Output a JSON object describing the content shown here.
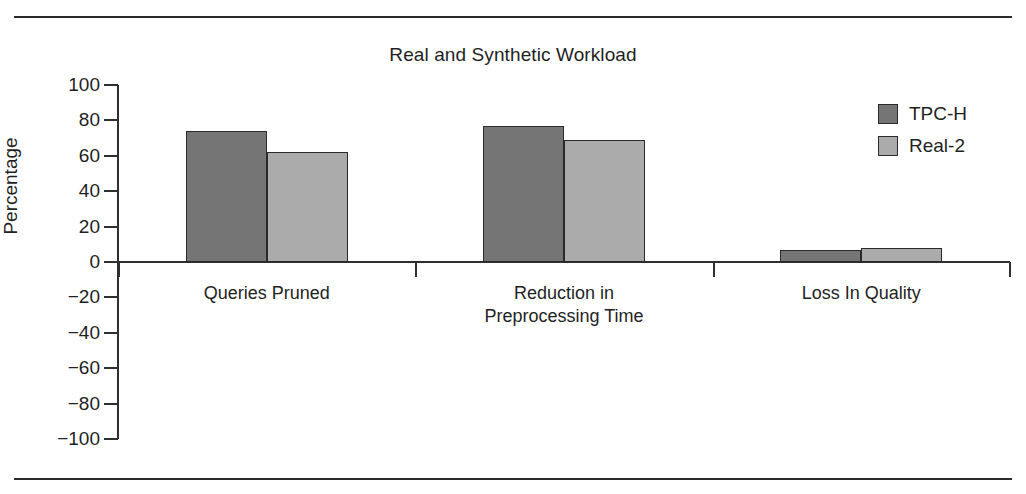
{
  "chart_data": {
    "type": "bar",
    "title": "Real and Synthetic Workload",
    "xlabel": "",
    "ylabel": "Percentage",
    "ylim": [
      -100,
      100
    ],
    "yticks": [
      100,
      80,
      60,
      40,
      20,
      0,
      -20,
      -40,
      -60,
      -80,
      -100
    ],
    "ytick_labels": [
      "100",
      "80",
      "60",
      "40",
      "20",
      "0",
      "−20",
      "−40",
      "−60",
      "−80",
      "−100"
    ],
    "grid": false,
    "legend_position": "top-right",
    "categories": [
      "Queries Pruned",
      "Reduction in\nPreprocessing Time",
      "Loss In Quality"
    ],
    "category_lines": [
      [
        "Queries Pruned"
      ],
      [
        "Reduction in",
        "Preprocessing Time"
      ],
      [
        "Loss In Quality"
      ]
    ],
    "series": [
      {
        "name": "TPC-H",
        "color": "#757575",
        "values": [
          74,
          77,
          7
        ]
      },
      {
        "name": "Real-2",
        "color": "#ababab",
        "values": [
          62,
          69,
          8
        ]
      }
    ]
  },
  "figure": {
    "top_rule": "horizontal-rule",
    "bottom_rule": "horizontal-rule"
  }
}
